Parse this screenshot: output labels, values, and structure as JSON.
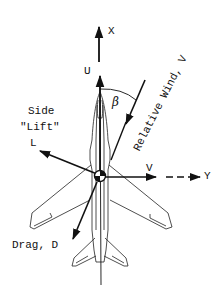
{
  "diagram": {
    "labels": {
      "x_axis": "X",
      "y_axis": "Y",
      "u_component": "U",
      "v_component": "V",
      "beta": "β",
      "relative_wind": "Relative Wind, V",
      "side_lift_line1": "Side",
      "side_lift_line2": "\"Lift\"",
      "side_lift_symbol": "L",
      "drag": "Drag, D"
    },
    "colors": {
      "ink": "#111111",
      "background": "#ffffff"
    },
    "elements": [
      {
        "name": "x-axis-arrow",
        "label": "X"
      },
      {
        "name": "u-velocity-arrow",
        "label": "U"
      },
      {
        "name": "relative-wind-arrow",
        "label": "Relative Wind, V"
      },
      {
        "name": "sideslip-angle-arc",
        "label": "β"
      },
      {
        "name": "side-lift-arrow",
        "label": "L"
      },
      {
        "name": "v-velocity-arrow",
        "label": "V"
      },
      {
        "name": "y-axis-arrow",
        "label": "Y"
      },
      {
        "name": "drag-arrow",
        "label": "Drag, D"
      },
      {
        "name": "aircraft-planform",
        "label": ""
      }
    ]
  }
}
